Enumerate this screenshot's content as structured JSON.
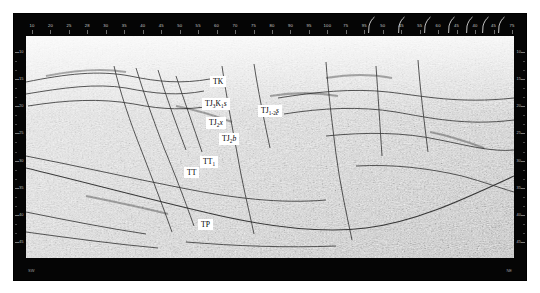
{
  "figure": {
    "type": "seismic-reflection-profile",
    "colors": {
      "frame": "#050505",
      "ruler_text": "#c9c9c9",
      "label_box": "#ffffff",
      "label_text": "#000000",
      "horizon_line": "#2a2a2a",
      "seismic_light": "#e6e6e6",
      "seismic_dark": "#3a3a3a"
    }
  },
  "top_ruler": {
    "name": "shot-point-ruler",
    "ticks": [
      "10",
      "20",
      "25",
      "28",
      "30",
      "35",
      "40",
      "45",
      "50",
      "55",
      "60",
      "70",
      "75",
      "80",
      "90",
      "95",
      "100",
      "75",
      "95",
      "50",
      "45",
      "55",
      "60",
      "45",
      "40",
      "45",
      "75"
    ],
    "crossing_markers": 7
  },
  "vertical_scale": {
    "name": "two-way-time-scale",
    "unit": "ms",
    "labels": [
      "10",
      "15",
      "20",
      "25",
      "30",
      "35",
      "40",
      "45"
    ]
  },
  "bottom_band": {
    "left_note": "SW",
    "right_note": "NE"
  },
  "interpretation_labels": [
    {
      "id": "TK",
      "main": "TK",
      "sub1": "",
      "tail": "",
      "tail_italic": false,
      "x": 196,
      "y": 62
    },
    {
      "id": "TJ3K1s",
      "main": "TJ",
      "sub1": "3",
      "mid": "K",
      "sub2": "1",
      "tail": "s",
      "tail_italic": true,
      "x": 188,
      "y": 84
    },
    {
      "id": "TJ2x",
      "main": "TJ",
      "sub1": "2",
      "tail": "x",
      "tail_italic": true,
      "x": 192,
      "y": 103
    },
    {
      "id": "TJ2b",
      "main": "TJ",
      "sub1": "2",
      "tail": "b",
      "tail_italic": true,
      "x": 205,
      "y": 119
    },
    {
      "id": "TJ12f",
      "main": "TJ",
      "sub1": "1-2",
      "tail": "ʃ",
      "tail_italic": true,
      "x": 244,
      "y": 91
    },
    {
      "id": "TT1",
      "main": "TT",
      "sub1": "1",
      "tail": "",
      "tail_italic": false,
      "x": 186,
      "y": 142
    },
    {
      "id": "TT",
      "main": "TT",
      "sub1": "",
      "tail": "",
      "tail_italic": false,
      "x": 170,
      "y": 153
    },
    {
      "id": "TP",
      "main": "TP",
      "sub1": "",
      "tail": "",
      "tail_italic": false,
      "x": 184,
      "y": 205
    }
  ]
}
